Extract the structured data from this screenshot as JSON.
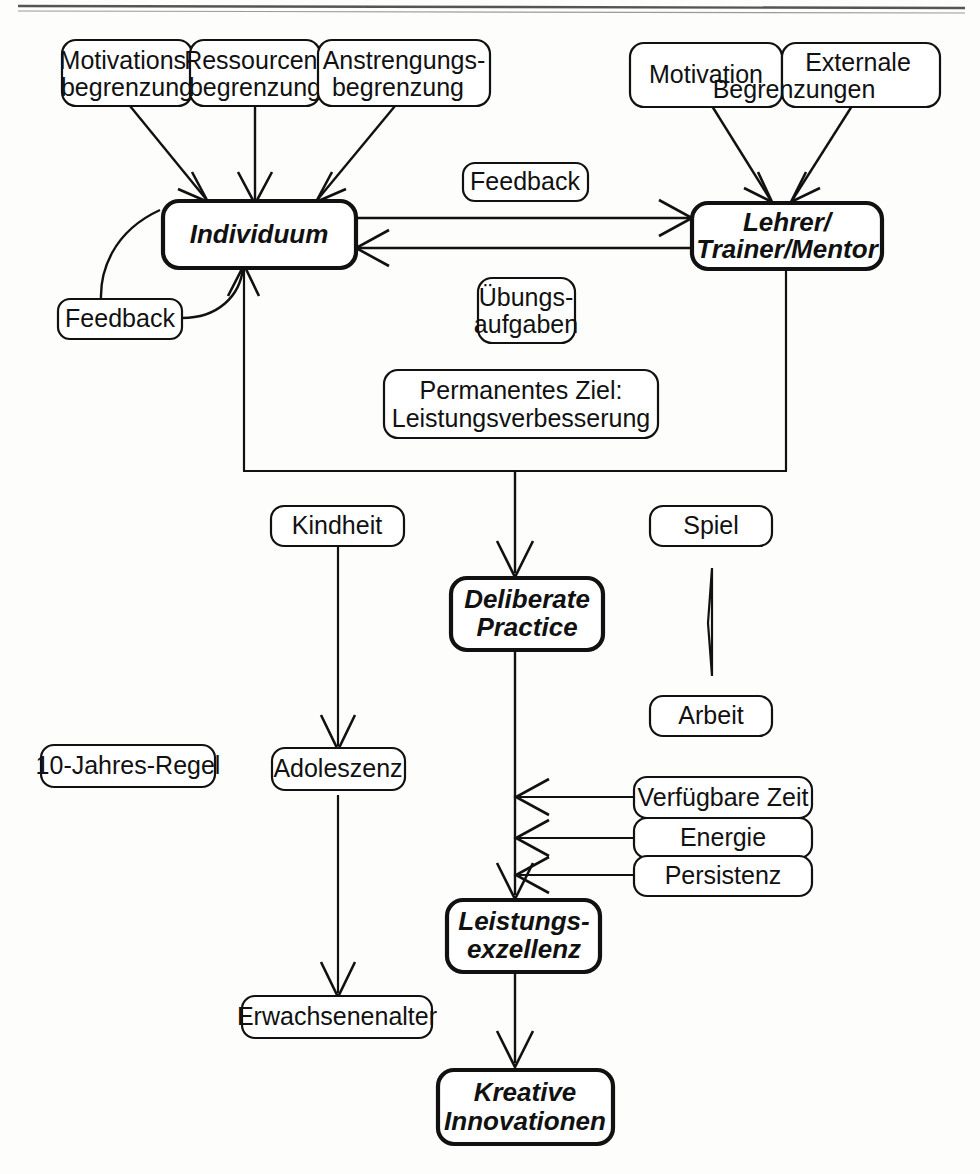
{
  "page": {
    "width": 980,
    "height": 1174,
    "background": "#fdfdfc",
    "line_color": "#111111",
    "rule_color": "#555555"
  },
  "nodes": {
    "motivationsbegrenzung": {
      "line1": "Motivations-",
      "line2": "begrenzung"
    },
    "ressourcenbegrenzung": {
      "line1": "Ressourcen-",
      "line2": "begrenzung"
    },
    "anstrengungsbegrenzung": {
      "line1": "Anstrengungs-",
      "line2": "begrenzung"
    },
    "motivation": {
      "line1": "Motivation"
    },
    "externale_begrenzungen": {
      "line1": "Externale",
      "line2": "Begrenzungen"
    },
    "individuum": {
      "line1": "Individuum"
    },
    "lehrer": {
      "line1": "Lehrer/",
      "line2": "Trainer/Mentor"
    },
    "feedback_top": {
      "line1": "Feedback"
    },
    "feedback_left": {
      "line1": "Feedback"
    },
    "uebungsaufgaben": {
      "line1": "Übungs-",
      "line2": "aufgaben"
    },
    "permanentes_ziel": {
      "line1": "Permanentes Ziel:",
      "line2": "Leistungsverbesserung"
    },
    "kindheit": {
      "line1": "Kindheit"
    },
    "spiel": {
      "line1": "Spiel"
    },
    "arbeit": {
      "line1": "Arbeit"
    },
    "deliberate_practice": {
      "line1": "Deliberate",
      "line2": "Practice"
    },
    "zehn_jahres_regel": {
      "line1": "10-Jahres-Regel"
    },
    "adoleszenz": {
      "line1": "Adoleszenz"
    },
    "erwachsenenalter": {
      "line1": "Erwachsenenalter"
    },
    "verfuegbare_zeit": {
      "line1": "Verfügbare Zeit"
    },
    "energie": {
      "line1": "Energie"
    },
    "persistenz": {
      "line1": "Persistenz"
    },
    "leistungsexzellenz": {
      "line1": "Leistungs-",
      "line2": "exzellenz"
    },
    "kreative_innovationen": {
      "line1": "Kreative",
      "line2": "Innovationen"
    }
  },
  "edges": [
    {
      "from": "motivationsbegrenzung",
      "to": "individuum",
      "style": "arrow"
    },
    {
      "from": "ressourcenbegrenzung",
      "to": "individuum",
      "style": "arrow"
    },
    {
      "from": "anstrengungsbegrenzung",
      "to": "individuum",
      "style": "arrow"
    },
    {
      "from": "motivation",
      "to": "lehrer",
      "style": "arrow"
    },
    {
      "from": "externale_begrenzungen",
      "to": "lehrer",
      "style": "arrow"
    },
    {
      "from": "individuum",
      "to": "lehrer",
      "style": "arrow",
      "label": "feedback_top"
    },
    {
      "from": "lehrer",
      "to": "individuum",
      "style": "arrow"
    },
    {
      "from": "individuum",
      "to": "feedback_left",
      "style": "curve"
    },
    {
      "from": "feedback_left",
      "to": "individuum",
      "style": "curve-arrow"
    },
    {
      "from": "individuum+lehrer",
      "to": "deliberate_practice",
      "style": "arrow"
    },
    {
      "from": "kindheit",
      "to": "adoleszenz",
      "style": "arrow"
    },
    {
      "from": "adoleszenz",
      "to": "erwachsenenalter",
      "style": "arrow"
    },
    {
      "from": "deliberate_practice",
      "to": "leistungsexzellenz",
      "style": "arrow"
    },
    {
      "from": "verfuegbare_zeit",
      "to": "dp-le-line",
      "style": "arrow"
    },
    {
      "from": "energie",
      "to": "dp-le-line",
      "style": "arrow"
    },
    {
      "from": "persistenz",
      "to": "dp-le-line",
      "style": "arrow"
    },
    {
      "from": "leistungsexzellenz",
      "to": "kreative_innovationen",
      "style": "arrow"
    }
  ],
  "shapes": {
    "triangle": {
      "name": "left-pointing-triangle",
      "between": [
        "spiel",
        "arbeit"
      ]
    }
  }
}
